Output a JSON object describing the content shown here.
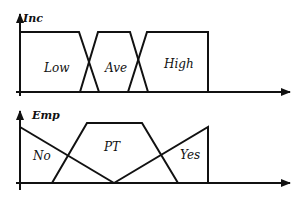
{
  "diagram": {
    "type": "fuzzy-membership-functions",
    "panels": [
      {
        "axis_label": "Inc",
        "sets": [
          {
            "label": "Low",
            "shape": "trapezoid-left-shoulder",
            "points": [
              [
                20,
                32
              ],
              [
                79,
                32
              ],
              [
                99,
                92
              ]
            ]
          },
          {
            "label": "Ave",
            "shape": "trapezoid",
            "points": [
              [
                80,
                92
              ],
              [
                98,
                32
              ],
              [
                130,
                32
              ],
              [
                148,
                92
              ]
            ]
          },
          {
            "label": "High",
            "shape": "trapezoid-right-closed",
            "points": [
              [
                128,
                92
              ],
              [
                147,
                32
              ],
              [
                208,
                32
              ],
              [
                208,
                92
              ]
            ]
          }
        ]
      },
      {
        "axis_label": "Emp",
        "sets": [
          {
            "label": "No",
            "shape": "descending-ramp",
            "points": [
              [
                20,
                127
              ],
              [
                114,
                183
              ]
            ]
          },
          {
            "label": "PT",
            "shape": "trapezoid",
            "points": [
              [
                52,
                183
              ],
              [
                87,
                123
              ],
              [
                142,
                123
              ],
              [
                178,
                183
              ]
            ]
          },
          {
            "label": "Yes",
            "shape": "ascending-ramp-closed",
            "points": [
              [
                114,
                183
              ],
              [
                208,
                127
              ],
              [
                208,
                183
              ]
            ]
          }
        ]
      }
    ]
  }
}
